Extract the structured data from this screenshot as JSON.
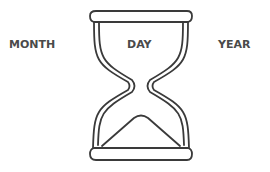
{
  "diagram": {
    "type": "hourglass-illustration",
    "labels": {
      "left": "MONTH",
      "center": "DAY",
      "right": "YEAR"
    },
    "icon": "hourglass-icon",
    "colors": {
      "stroke": "#3a3a3a",
      "text": "#4a4a4a",
      "background": "#ffffff"
    }
  }
}
